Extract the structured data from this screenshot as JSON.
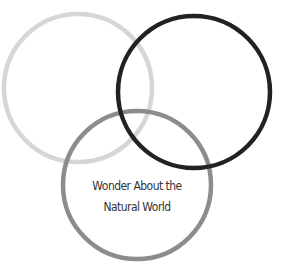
{
  "diagram": {
    "type": "venn",
    "circles": [
      {
        "id": "top-left",
        "cx": 78,
        "cy": 88,
        "r": 74,
        "stroke": "#d6d6d6",
        "stroke_width": 4.5,
        "label": ""
      },
      {
        "id": "bottom",
        "cx": 137,
        "cy": 185,
        "r": 74,
        "stroke": "#8c8c8c",
        "stroke_width": 4.5,
        "label": "Wonder About the Natural World"
      },
      {
        "id": "top-right",
        "cx": 194,
        "cy": 92,
        "r": 76,
        "stroke": "#222222",
        "stroke_width": 4.5,
        "label": ""
      }
    ],
    "label": {
      "line1": "Wonder About the",
      "line2": "Natural World"
    }
  }
}
